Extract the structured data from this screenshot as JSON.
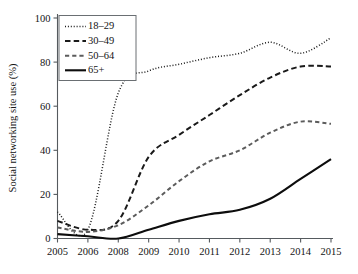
{
  "chart_data": {
    "type": "line",
    "title": "",
    "xlabel": "",
    "ylabel": "Social networking site use (%)",
    "x": [
      2005,
      2006,
      2008,
      2009,
      2010,
      2011,
      2012,
      2013,
      2014,
      2015
    ],
    "xtick_labels": [
      "2005",
      "2006",
      "2008",
      "2009",
      "2010",
      "2011",
      "2012",
      "2013",
      "2014",
      "2015"
    ],
    "ytick_labels": [
      "0",
      "20",
      "40",
      "60",
      "80",
      "100"
    ],
    "ytick_values": [
      0,
      20,
      40,
      60,
      80,
      100
    ],
    "ylim": [
      0,
      100
    ],
    "grid": false,
    "legend_position": "top-left",
    "series": [
      {
        "name": "18–29",
        "style": "dotted",
        "color": "#1a1a1a",
        "values": [
          12,
          4,
          66,
          76,
          79,
          82,
          84,
          89,
          84,
          91
        ]
      },
      {
        "name": "30–49",
        "style": "long-dash",
        "color": "#1a1a1a",
        "values": [
          8,
          4,
          8,
          37,
          47,
          56,
          65,
          73,
          78,
          78
        ]
      },
      {
        "name": "50–64",
        "style": "dash",
        "color": "#5c5c5c",
        "values": [
          5,
          3,
          6,
          15,
          26,
          35,
          40,
          48,
          53,
          52
        ]
      },
      {
        "name": "65+",
        "style": "solid",
        "color": "#0d0d0d",
        "values": [
          2,
          1,
          0,
          4,
          8,
          11,
          13,
          18,
          27,
          36
        ]
      }
    ],
    "annotations": []
  },
  "legend": {
    "entries": [
      {
        "label": "18–29"
      },
      {
        "label": "30–49"
      },
      {
        "label": "50–64"
      },
      {
        "label": "65+"
      }
    ]
  }
}
